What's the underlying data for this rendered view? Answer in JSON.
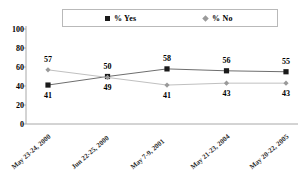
{
  "chart_data": {
    "type": "line",
    "title": "",
    "xlabel": "",
    "ylabel": "",
    "ylim": [
      0,
      100
    ],
    "ytick_step": 20,
    "ytick_labels": [
      "100",
      "80",
      "60",
      "40",
      "20",
      "0"
    ],
    "grid": false,
    "legend_position": "top",
    "categories": [
      "May 23-24, 2000",
      "Jun 22-25, 2000",
      "May 7-9, 2001",
      "May 21-23, 2004",
      "May 20-22, 2005"
    ],
    "series": [
      {
        "name": "% Yes",
        "marker": "square",
        "color": "#1a1a1a",
        "line_color": "#6e6e6e",
        "values": [
          41,
          50,
          58,
          56,
          55
        ],
        "label_position": [
          "below",
          "above",
          "above",
          "above",
          "above"
        ]
      },
      {
        "name": "% No",
        "marker": "diamond",
        "color": "#9a9a9a",
        "line_color": "#c0c0c0",
        "values": [
          57,
          49,
          41,
          43,
          43
        ],
        "label_position": [
          "above",
          "below",
          "below",
          "below",
          "below"
        ]
      }
    ]
  },
  "legend": {
    "entries": [
      {
        "label": "% Yes",
        "marker": "square"
      },
      {
        "label": "% No",
        "marker": "diamond"
      }
    ]
  },
  "colors": {
    "yes_marker": "#1a1a1a",
    "no_marker": "#9a9a9a",
    "axis": "#a8a8a8",
    "legend_border": "#b9b9b9",
    "background": "#ffffff"
  }
}
